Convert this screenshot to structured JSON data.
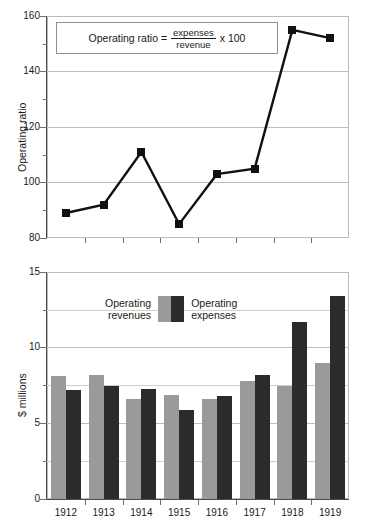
{
  "chart_data": [
    {
      "type": "line",
      "title": "",
      "xlabel": "",
      "ylabel": "Operating ratio",
      "categories": [
        "1912",
        "1913",
        "1914",
        "1915",
        "1916",
        "1917",
        "1918",
        "1919"
      ],
      "values": [
        89,
        92,
        111,
        85,
        103,
        105,
        155,
        152
      ],
      "series": [
        {
          "name": "Operating ratio",
          "values": [
            89,
            92,
            111,
            85,
            103,
            105,
            155,
            152
          ]
        }
      ],
      "ylim": [
        80,
        160
      ],
      "yticks": [
        80,
        100,
        120,
        140,
        160
      ],
      "ytick_labels": [
        "80",
        "100",
        "120",
        "140",
        "160"
      ],
      "yminor_step": 10,
      "grid": true,
      "legend": "none",
      "marker": "square",
      "line_color": "#111111",
      "annotation": {
        "text": "Operating ratio = expenses / revenue x 100",
        "lead": "Operating ratio =",
        "numerator": "expenses",
        "denominator": "revenue",
        "multiplier": "x 100",
        "boxed": true
      }
    },
    {
      "type": "bar",
      "title": "",
      "xlabel": "",
      "ylabel": "$ millions",
      "categories": [
        "1912",
        "1913",
        "1914",
        "1915",
        "1916",
        "1917",
        "1918",
        "1919"
      ],
      "series": [
        {
          "name": "Operating revenues",
          "color": "#9a9a9a",
          "values": [
            8.1,
            8.2,
            6.6,
            6.9,
            6.6,
            7.8,
            7.5,
            9.0
          ]
        },
        {
          "name": "Operating expenses",
          "color": "#2b2b2b",
          "values": [
            7.2,
            7.5,
            7.3,
            5.9,
            6.8,
            8.2,
            11.7,
            13.4
          ]
        }
      ],
      "ylim": [
        0,
        15
      ],
      "yticks": [
        0,
        5,
        10,
        15
      ],
      "ytick_labels": [
        "0",
        "5",
        "10",
        "15"
      ],
      "yminor_step": 2.5,
      "grid": true,
      "legend": "inside-top-left",
      "legend_entries": [
        {
          "label_line1": "Operating",
          "label_line2": "revenues",
          "color": "#9a9a9a"
        },
        {
          "label_line1": "Operating",
          "label_line2": "expenses",
          "color": "#2b2b2b"
        }
      ]
    }
  ],
  "top_chart": {
    "ylabel": "Operating ratio",
    "ytick_labels": [
      "160",
      "140",
      "120",
      "100",
      "80"
    ],
    "formula": {
      "lead": "Operating ratio =",
      "numerator": "expenses",
      "denominator": "revenue",
      "multiplier": "x 100"
    }
  },
  "bottom_chart": {
    "ylabel": "$ millions",
    "ytick_labels": [
      "15",
      "10",
      "5",
      "0"
    ],
    "xtick_labels": [
      "1912",
      "1913",
      "1914",
      "1915",
      "1916",
      "1917",
      "1918",
      "1919"
    ],
    "legend": {
      "revenues_line1": "Operating",
      "revenues_line2": "revenues",
      "expenses_line1": "Operating",
      "expenses_line2": "expenses"
    }
  }
}
